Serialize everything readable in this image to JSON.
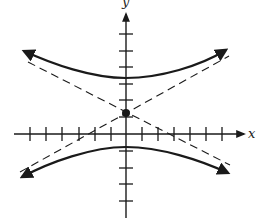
{
  "diagram": {
    "type": "hyperbola-graph",
    "axes": {
      "x_label": "x",
      "y_label": "y",
      "x_tick_count_left": 6,
      "x_tick_count_right": 6,
      "y_tick_count_up": 6,
      "y_tick_count_down": 5
    },
    "features": {
      "branches": [
        "upper",
        "lower"
      ],
      "asymptotes": "dashed, crossing at center",
      "center_marker": "filled dot at center"
    },
    "colors": {
      "ink": "#1a1a1a",
      "background": "#ffffff"
    }
  }
}
